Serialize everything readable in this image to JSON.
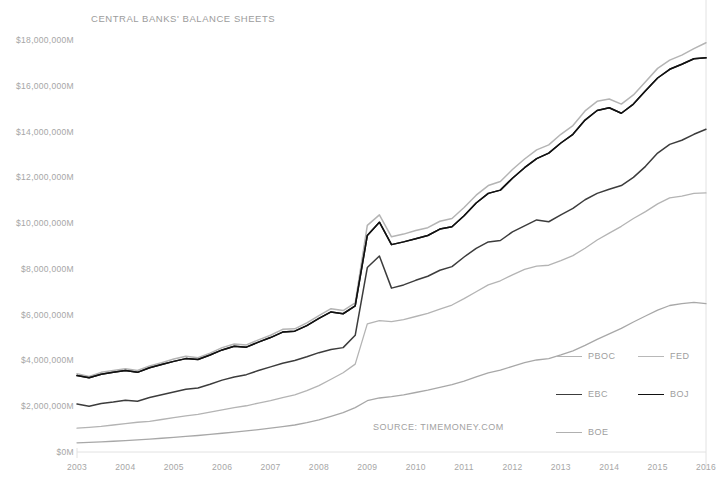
{
  "chart_data": {
    "type": "line",
    "title": "CENTRAL BANKS' BALANCE SHEETS",
    "source": "SOURCE: TIMEMONEY.COM",
    "xlabel": "",
    "ylabel": "",
    "grid": false,
    "legend_position": "bottom-right",
    "xlim": [
      2003,
      2016
    ],
    "ylim": [
      0,
      18000000
    ],
    "y_unit": "$M",
    "y_ticks": [
      0,
      2000000,
      4000000,
      6000000,
      8000000,
      10000000,
      12000000,
      14000000,
      16000000,
      18000000
    ],
    "y_tick_labels": [
      "$0M",
      "$2,000,000M",
      "$4,000,000M",
      "$6,000,000M",
      "$8,000,000M",
      "$10,000,000M",
      "$12,000,000M",
      "$14,000,000M",
      "$16,000,000M",
      "$18,000,000M"
    ],
    "x_ticks": [
      2003,
      2004,
      2005,
      2006,
      2007,
      2008,
      2009,
      2010,
      2011,
      2012,
      2013,
      2014,
      2015,
      2016
    ],
    "x_tick_labels": [
      "2003",
      "2004",
      "2005",
      "2006",
      "2007",
      "2008",
      "2009",
      "2010",
      "2011",
      "2012",
      "2013",
      "2014",
      "2015",
      "2016"
    ],
    "x": [
      2003,
      2003.25,
      2003.5,
      2003.75,
      2004,
      2004.25,
      2004.5,
      2004.75,
      2005,
      2005.25,
      2005.5,
      2005.75,
      2006,
      2006.25,
      2006.5,
      2006.75,
      2007,
      2007.25,
      2007.5,
      2007.75,
      2008,
      2008.25,
      2008.5,
      2008.75,
      2009,
      2009.25,
      2009.5,
      2009.75,
      2010,
      2010.25,
      2010.5,
      2010.75,
      2011,
      2011.25,
      2011.5,
      2011.75,
      2012,
      2012.25,
      2012.5,
      2012.75,
      2013,
      2013.25,
      2013.5,
      2013.75,
      2014,
      2014.25,
      2014.5,
      2014.75,
      2015,
      2015.25,
      2015.5,
      2015.75,
      2016
    ],
    "series": [
      {
        "name": "PBOC",
        "color": "#b4b4b4",
        "width": 1.5,
        "values": [
          3420000,
          3300000,
          3480000,
          3560000,
          3640000,
          3560000,
          3760000,
          3900000,
          4060000,
          4180000,
          4120000,
          4320000,
          4560000,
          4720000,
          4680000,
          4900000,
          5100000,
          5360000,
          5380000,
          5640000,
          5960000,
          6260000,
          6180000,
          6520000,
          9900000,
          10360000,
          9400000,
          9520000,
          9680000,
          9800000,
          10080000,
          10200000,
          10680000,
          11220000,
          11640000,
          11820000,
          12340000,
          12800000,
          13200000,
          13420000,
          13880000,
          14260000,
          14900000,
          15320000,
          15420000,
          15200000,
          15600000,
          16180000,
          16760000,
          17120000,
          17340000,
          17620000,
          17880000
        ]
      },
      {
        "name": "FED",
        "color": "#2b2b2b",
        "width": 1.5,
        "values": [
          3340000,
          3240000,
          3400000,
          3480000,
          3560000,
          3480000,
          3680000,
          3820000,
          3960000,
          4080000,
          4040000,
          4240000,
          4460000,
          4620000,
          4580000,
          4800000,
          5000000,
          5240000,
          5280000,
          5520000,
          5840000,
          6120000,
          6040000,
          6380000,
          9460000,
          10040000,
          9060000,
          9180000,
          9320000,
          9460000,
          9740000,
          9840000,
          10320000,
          10880000,
          11300000,
          11440000,
          11960000,
          12420000,
          12820000,
          13060000,
          13500000,
          13880000,
          14500000,
          14920000,
          15040000,
          14800000,
          15200000,
          15780000,
          16340000,
          16720000,
          16940000,
          17180000,
          17220000
        ]
      },
      {
        "name": "EBC",
        "color": "#3c3c3c",
        "width": 1.5,
        "values": [
          2100000,
          2000000,
          2120000,
          2180000,
          2260000,
          2220000,
          2380000,
          2500000,
          2620000,
          2740000,
          2800000,
          2960000,
          3140000,
          3280000,
          3380000,
          3560000,
          3720000,
          3880000,
          4000000,
          4160000,
          4340000,
          4480000,
          4560000,
          5100000,
          8060000,
          8560000,
          7160000,
          7300000,
          7500000,
          7680000,
          7940000,
          8100000,
          8520000,
          8900000,
          9180000,
          9240000,
          9620000,
          9880000,
          10140000,
          10060000,
          10360000,
          10640000,
          11020000,
          11300000,
          11480000,
          11640000,
          12000000,
          12480000,
          13060000,
          13440000,
          13620000,
          13880000,
          14100000
        ]
      },
      {
        "name": "BOJ",
        "color": "#111111",
        "width": 1.5,
        "values": [
          3340000,
          3240000,
          3400000,
          3480000,
          3560000,
          3480000,
          3680000,
          3820000,
          3960000,
          4080000,
          4040000,
          4240000,
          4460000,
          4620000,
          4580000,
          4800000,
          5000000,
          5240000,
          5280000,
          5520000,
          5840000,
          6120000,
          6040000,
          6380000,
          9460000,
          10040000,
          9060000,
          9180000,
          9320000,
          9460000,
          9740000,
          9840000,
          10320000,
          10880000,
          11300000,
          11440000,
          11960000,
          12420000,
          12820000,
          13060000,
          13500000,
          13880000,
          14500000,
          14920000,
          15040000,
          14800000,
          15200000,
          15780000,
          16340000,
          16720000,
          16940000,
          17180000,
          17220000
        ]
      },
      {
        "name": "BOE",
        "color": "#b4b4b4",
        "width": 1.3,
        "values": [
          1040000,
          1080000,
          1120000,
          1180000,
          1240000,
          1300000,
          1340000,
          1420000,
          1500000,
          1580000,
          1640000,
          1740000,
          1840000,
          1940000,
          2020000,
          2140000,
          2240000,
          2380000,
          2500000,
          2680000,
          2900000,
          3180000,
          3460000,
          3840000,
          5600000,
          5740000,
          5700000,
          5780000,
          5920000,
          6060000,
          6240000,
          6420000,
          6700000,
          7000000,
          7300000,
          7480000,
          7740000,
          7980000,
          8120000,
          8160000,
          8360000,
          8580000,
          8900000,
          9260000,
          9560000,
          9860000,
          10200000,
          10500000,
          10840000,
          11100000,
          11180000,
          11300000,
          11320000
        ]
      },
      {
        "name": "BOE-lower",
        "color": "#a8a8a8",
        "width": 1.3,
        "values": [
          400000,
          420000,
          440000,
          470000,
          500000,
          530000,
          560000,
          600000,
          640000,
          680000,
          720000,
          770000,
          820000,
          870000,
          920000,
          980000,
          1040000,
          1110000,
          1180000,
          1280000,
          1400000,
          1560000,
          1720000,
          1940000,
          2240000,
          2360000,
          2420000,
          2500000,
          2600000,
          2700000,
          2820000,
          2940000,
          3100000,
          3280000,
          3460000,
          3580000,
          3740000,
          3900000,
          4020000,
          4080000,
          4240000,
          4420000,
          4660000,
          4920000,
          5160000,
          5400000,
          5680000,
          5940000,
          6200000,
          6400000,
          6480000,
          6540000,
          6480000
        ]
      }
    ]
  },
  "legend": {
    "items": [
      {
        "label": "PBOC",
        "color": "#b4b4b4",
        "width": 1.4
      },
      {
        "label": "FED",
        "color": "#b8b8b8",
        "width": 1.4
      },
      {
        "label": "EBC",
        "color": "#3c3c3c",
        "width": 1.8
      },
      {
        "label": "BOJ",
        "color": "#111111",
        "width": 1.8
      },
      {
        "label": "BOE",
        "color": "#b0b0b0",
        "width": 1.4
      }
    ]
  },
  "axis": {
    "line_color": "#e2e2e2"
  }
}
